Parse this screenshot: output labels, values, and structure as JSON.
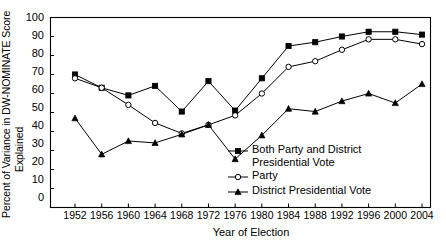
{
  "chart_data": {
    "type": "line",
    "title": "",
    "xlabel": "Year of Election",
    "ylabel": "Percent of Variance in DW-NOMINATE Score Explained",
    "ylabel_line1": "Percent of Variance in DW-NOMINATE Score",
    "ylabel_line2": "Explained",
    "categories": [
      "1952",
      "1956",
      "1960",
      "1964",
      "1968",
      "1972",
      "1976",
      "1980",
      "1984",
      "1988",
      "1992",
      "1996",
      "2000",
      "2004"
    ],
    "x": [
      1952,
      1956,
      1960,
      1964,
      1968,
      1972,
      1976,
      1980,
      1984,
      1988,
      1992,
      1996,
      2000,
      2004
    ],
    "ylim": [
      0,
      100
    ],
    "yticks": [
      "0",
      "10",
      "20",
      "30",
      "40",
      "50",
      "60",
      "70",
      "80",
      "90",
      "100"
    ],
    "ytick_values": [
      0,
      10,
      20,
      30,
      40,
      50,
      60,
      70,
      80,
      90,
      100
    ],
    "xlim": [
      1950,
      2006
    ],
    "grid": false,
    "legend_position": "inside-bottom-right",
    "series": [
      {
        "name": "Both Party and District Presidential Vote",
        "marker": "filled-square",
        "color": "#000000",
        "values": [
          70,
          63,
          59,
          64,
          50.5,
          66.5,
          51,
          68,
          85,
          87,
          90,
          92.5,
          92.5,
          91
        ]
      },
      {
        "name": "Party",
        "marker": "open-circle",
        "color": "#000000",
        "values": [
          68,
          63,
          54,
          44.5,
          39,
          43.5,
          48.5,
          60,
          74,
          77,
          83,
          88.5,
          88.5,
          86
        ]
      },
      {
        "name": "District Presidential Vote",
        "marker": "filled-triangle",
        "color": "#000000",
        "values": [
          47,
          28,
          35,
          34,
          38.5,
          43.5,
          25.5,
          38,
          52,
          50.5,
          56,
          60,
          55,
          65
        ]
      }
    ]
  },
  "legend": {
    "items": [
      {
        "label_line1": "Both Party and District",
        "label_line2": "Presidential Vote",
        "marker": "filled-square"
      },
      {
        "label_line1": "Party",
        "label_line2": "",
        "marker": "open-circle"
      },
      {
        "label_line1": "District Presidential Vote",
        "label_line2": "",
        "marker": "filled-triangle"
      }
    ]
  },
  "axes": {
    "x_title": "Year of Election",
    "y_title_line1": "Percent of Variance in DW-NOMINATE Score",
    "y_title_line2": "Explained"
  },
  "colors": {
    "axis": "#000000",
    "line": "#000000",
    "background": "#ffffff"
  }
}
